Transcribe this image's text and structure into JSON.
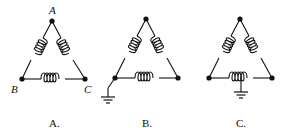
{
  "figures": [
    {
      "id": "A",
      "caption": "A.",
      "vertex_labels": {
        "top": "A",
        "left": "B",
        "right": "C"
      },
      "ground": "none"
    },
    {
      "id": "B",
      "caption": "B.",
      "vertex_labels": {
        "top": "",
        "left": "",
        "right": ""
      },
      "ground": "left-vertex"
    },
    {
      "id": "C",
      "caption": "C.",
      "vertex_labels": {
        "top": "",
        "left": "",
        "right": ""
      },
      "ground": "bottom-coil-center-tap"
    }
  ],
  "colors": {
    "ink": "#111111",
    "background": "#ffffff"
  }
}
